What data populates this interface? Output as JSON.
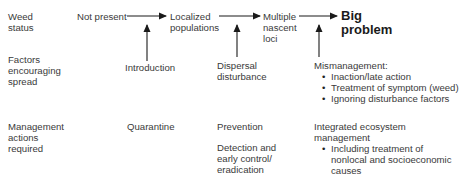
{
  "rows": {
    "weed_status": {
      "label_lines": [
        "Weed",
        "status"
      ],
      "stages": [
        {
          "lines": [
            "Not present"
          ]
        },
        {
          "lines": [
            "Localized",
            "populations"
          ]
        },
        {
          "lines": [
            "Multiple",
            "nascent",
            "loci"
          ]
        },
        {
          "lines": [
            "Big",
            "problem"
          ],
          "emphasis": "bold"
        }
      ]
    },
    "factors": {
      "label_lines": [
        "Factors",
        "encouraging",
        "spread"
      ],
      "items": [
        {
          "lines": [
            "Introduction"
          ]
        },
        {
          "lines": [
            "Dispersal",
            "disturbance"
          ]
        },
        {
          "heading": "Mismanagement:",
          "bullets": [
            "Inaction/late action",
            "Treatment of symptom (weed)",
            "Ignoring disturbance factors"
          ]
        }
      ]
    },
    "management": {
      "label_lines": [
        "Management",
        "actions",
        "required"
      ],
      "items": [
        {
          "lines": [
            "Quarantine"
          ]
        },
        {
          "lines": [
            "Prevention"
          ],
          "extra_lines": [
            "Detection and",
            "early control/",
            "eradication"
          ]
        },
        {
          "heading_lines": [
            "Integrated ecosystem",
            "management"
          ],
          "bullets": [
            [
              "Including treatment of",
              "nonlocal and socioeconomic",
              "causes"
            ]
          ]
        }
      ]
    }
  },
  "arrow_color": "#1a1a1a"
}
